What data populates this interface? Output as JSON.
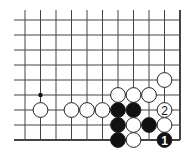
{
  "diagram": {
    "type": "go-board-fragment",
    "grid": {
      "cols": 11,
      "rows": 9,
      "x0": 25,
      "dx": 15.5,
      "y0": 20,
      "dy": 15,
      "open_left": true,
      "open_top": true,
      "edge_right": true,
      "edge_bottom": true,
      "line_color": "#444444"
    },
    "hoshi": [
      {
        "col": 1,
        "row": 5
      }
    ],
    "stones": [
      {
        "col": 9,
        "row": 4,
        "color": "white"
      },
      {
        "col": 6,
        "row": 5,
        "color": "white"
      },
      {
        "col": 7,
        "row": 5,
        "color": "white"
      },
      {
        "col": 8,
        "row": 5,
        "color": "white"
      },
      {
        "col": 1,
        "row": 6,
        "color": "white"
      },
      {
        "col": 3,
        "row": 6,
        "color": "white"
      },
      {
        "col": 4,
        "row": 6,
        "color": "white"
      },
      {
        "col": 5,
        "row": 6,
        "color": "white"
      },
      {
        "col": 6,
        "row": 6,
        "color": "black"
      },
      {
        "col": 7,
        "row": 6,
        "color": "black"
      },
      {
        "col": 9,
        "row": 6,
        "color": "white",
        "label": "2"
      },
      {
        "col": 6,
        "row": 7,
        "color": "black"
      },
      {
        "col": 7,
        "row": 7,
        "color": "white"
      },
      {
        "col": 8,
        "row": 7,
        "color": "black"
      },
      {
        "col": 9,
        "row": 7,
        "color": "white"
      },
      {
        "col": 6,
        "row": 8,
        "color": "black"
      },
      {
        "col": 7,
        "row": 8,
        "color": "white"
      },
      {
        "col": 9,
        "row": 8,
        "color": "black",
        "label": "1"
      }
    ],
    "colors": {
      "black_stone": "#111111",
      "white_stone": "#ffffff",
      "stone_outline": "#222222"
    }
  }
}
